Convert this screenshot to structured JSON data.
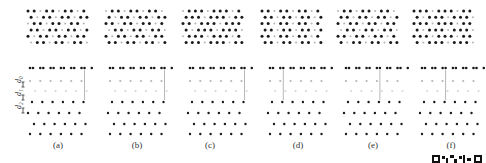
{
  "figure": {
    "panels": [
      {
        "label": "(a)",
        "cx": 58,
        "top_x": 28,
        "side_x": 30,
        "pattern": "hex-sparse",
        "shade": "light",
        "cut_col": 5
      },
      {
        "label": "(b)",
        "cx": 137,
        "top_x": 106,
        "side_x": 110,
        "pattern": "hex-honeycomb",
        "shade": "light",
        "cut_col": 5
      },
      {
        "label": "(c)",
        "cx": 210,
        "top_x": 183,
        "side_x": 190,
        "pattern": "hex-dense",
        "shade": "light",
        "cut_col": 5
      },
      {
        "label": "(d)",
        "cx": 298,
        "top_x": 262,
        "side_x": 270,
        "pattern": "pairs",
        "shade": "dark",
        "cut_col": 1
      },
      {
        "label": "(e)",
        "cx": 373,
        "top_x": 338,
        "side_x": 346,
        "pattern": "pairs-offset",
        "shade": "dark",
        "cut_col": 3
      },
      {
        "label": "(f)",
        "cx": 451,
        "top_x": 414,
        "side_x": 422,
        "pattern": "triples",
        "shade": "dark",
        "cut_col": 2
      }
    ],
    "side_view_labels": [
      "d2",
      "d1",
      "d0"
    ],
    "colors": {
      "atom_dark": "#1a1a1a",
      "atom_light": "#b5b5b5",
      "bond": "#cfcfcf",
      "guide_line": "#9a9a9a",
      "text": "#333333"
    }
  }
}
